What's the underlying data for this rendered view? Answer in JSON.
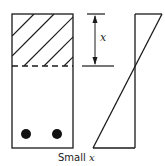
{
  "diagram": {
    "caption": "Small x",
    "dimension_label": "x",
    "colors": {
      "stroke": "#1a1a1a",
      "background": "#ffffff"
    },
    "section": {
      "description": "beam cross-section with hatched compression zone above neutral axis and two reinforcement bars",
      "bars_count": 2
    },
    "strain_diagram": {
      "description": "linear strain distribution crossing zero at neutral axis"
    }
  }
}
